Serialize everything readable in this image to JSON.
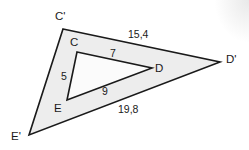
{
  "figure": {
    "background_color": "#ffffff",
    "stroke_color": "#1a1a1a",
    "outer_fill_color": "#ededed",
    "inner_fill_color": "#fbfbfb",
    "outer_triangle": {
      "name": "triangle-c-prime-d-prime-e-prime",
      "points": "63,29 220,62 29,135",
      "vertices": [
        {
          "id": "C-prime",
          "label": "C'",
          "x": 63,
          "y": 29,
          "label_x": 55,
          "label_y": 20
        },
        {
          "id": "D-prime",
          "label": "D'",
          "x": 220,
          "y": 62,
          "label_x": 226,
          "label_y": 63
        },
        {
          "id": "E-prime",
          "label": "E'",
          "x": 29,
          "y": 135,
          "label_x": 11,
          "label_y": 140
        }
      ],
      "sides": [
        {
          "id": "side-c-prime-d-prime",
          "label": "15,4",
          "label_x": 128,
          "label_y": 38
        },
        {
          "id": "side-e-prime-d-prime",
          "label": "19,8",
          "label_x": 118,
          "label_y": 113
        }
      ]
    },
    "inner_triangle": {
      "name": "triangle-c-d-e",
      "points": "77,52 152,68 67,100",
      "vertices": [
        {
          "id": "C",
          "label": "C",
          "x": 77,
          "y": 52,
          "label_x": 70,
          "label_y": 46
        },
        {
          "id": "D",
          "label": "D",
          "x": 152,
          "y": 68,
          "label_x": 155,
          "label_y": 72
        },
        {
          "id": "E",
          "label": "E",
          "x": 67,
          "y": 100,
          "label_x": 54,
          "label_y": 112
        }
      ],
      "sides": [
        {
          "id": "side-c-d",
          "label": "7",
          "label_x": 110,
          "label_y": 57
        },
        {
          "id": "side-c-e",
          "label": "5",
          "label_x": 61,
          "label_y": 80
        },
        {
          "id": "side-e-d",
          "label": "9",
          "label_x": 102,
          "label_y": 95
        }
      ]
    }
  }
}
